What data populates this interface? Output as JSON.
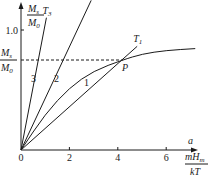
{
  "chart_data": {
    "type": "line",
    "title": "",
    "ylabel": {
      "num": "M",
      "num_sub": "s",
      "den": "M",
      "den_sub": "0"
    },
    "xlabel": {
      "num": "mH",
      "num_sub": "m",
      "den": "kT"
    },
    "x_axis_symbol": "a",
    "xlim": [
      0,
      7.3
    ],
    "ylim": [
      0,
      1.25
    ],
    "x_ticks": [
      "0",
      "2",
      "4",
      "6"
    ],
    "x_tick_values": [
      0,
      2,
      4,
      6
    ],
    "y_ticks": [
      "1.0"
    ],
    "y_tick_values": [
      1.0
    ],
    "saturation_level": {
      "label_num": "M",
      "label_num_sub": "s",
      "label_den": "M",
      "label_den_sub": "0",
      "value": 0.75
    },
    "point": {
      "label": "P",
      "x": 4.2,
      "y": 0.75
    },
    "series": [
      {
        "name": "1",
        "kind": "curve",
        "label": "1",
        "points": [
          [
            0,
            0
          ],
          [
            1,
            0.3
          ],
          [
            2,
            0.52
          ],
          [
            3,
            0.66
          ],
          [
            4.2,
            0.75
          ],
          [
            5,
            0.8
          ],
          [
            6,
            0.83
          ],
          [
            7.2,
            0.845
          ]
        ]
      },
      {
        "name": "T1",
        "kind": "line",
        "label": "1",
        "temp_label": "T",
        "temp_sub": "1",
        "slope": 0.18,
        "x_end": 4.8
      },
      {
        "name": "T2",
        "kind": "line",
        "label": "2",
        "temp_label": "T",
        "temp_sub": "2",
        "slope": 0.43,
        "x_end": 2.9
      },
      {
        "name": "T3",
        "kind": "line",
        "label": "3",
        "temp_label": "T",
        "temp_sub": "3",
        "slope": 1.05,
        "x_end": 1.05
      }
    ]
  }
}
